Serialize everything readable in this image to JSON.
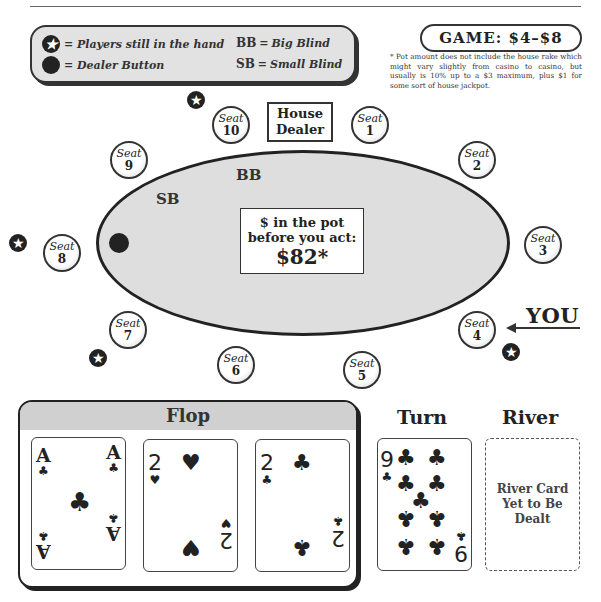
{
  "legend": {
    "star_label": "= Players still in the hand",
    "dealer_label": "= Dealer Button",
    "bb_abbr": "BB",
    "bb_eq": "=",
    "bb_text": "Big Blind",
    "sb_abbr": "SB",
    "sb_eq": "=",
    "sb_text": "Small Blind"
  },
  "game": {
    "label": "GAME: $4–$8"
  },
  "footnote": "* Pot amount does not include the house rake which might vary slightly from casino to casino, but usually is 10% up to a $3 maximum, plus $1 for some sort of house jackpot.",
  "table": {
    "house_dealer_line1": "House",
    "house_dealer_line2": "Dealer",
    "sb_label": "SB",
    "bb_label": "BB",
    "pot_line1": "$ in the pot",
    "pot_line2": "before you act:",
    "pot_amount": "$82*",
    "seat_word": "Seat",
    "seats": [
      {
        "number": "1"
      },
      {
        "number": "2"
      },
      {
        "number": "3"
      },
      {
        "number": "4"
      },
      {
        "number": "5"
      },
      {
        "number": "6"
      },
      {
        "number": "7"
      },
      {
        "number": "8"
      },
      {
        "number": "9"
      },
      {
        "number": "10"
      }
    ],
    "players_in_hand": [
      "10",
      "8",
      "7",
      "4"
    ],
    "dealer_button_seat": "8",
    "you_label": "YOU",
    "you_seat": "4"
  },
  "board": {
    "flop_title": "Flop",
    "turn_title": "Turn",
    "river_title": "River",
    "flop": [
      {
        "rank": "A",
        "suit": "♣",
        "suit_name": "clubs"
      },
      {
        "rank": "2",
        "suit": "♥",
        "suit_name": "hearts"
      },
      {
        "rank": "2",
        "suit": "♣",
        "suit_name": "clubs"
      }
    ],
    "turn": {
      "rank": "9",
      "suit": "♣",
      "suit_name": "clubs"
    },
    "river_placeholder": "River Card Yet to Be Dealt",
    "river_line1": "River Card",
    "river_line2": "Yet to Be",
    "river_line3": "Dealt"
  },
  "icons": {
    "star": "★",
    "club": "♣",
    "heart": "♥"
  }
}
